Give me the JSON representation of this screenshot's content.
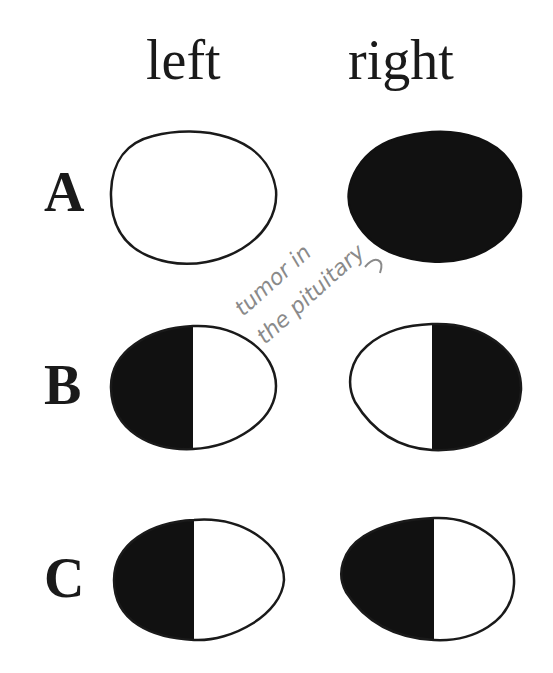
{
  "columns": {
    "left": "left",
    "right": "right"
  },
  "rows": [
    {
      "label": "A",
      "left": "none",
      "right": "full"
    },
    {
      "label": "B",
      "left": "left-half",
      "right": "right-half"
    },
    {
      "label": "C",
      "left": "left-half",
      "right": "left-half"
    }
  ],
  "annotation": {
    "line1": "tumor in",
    "line2": "the pituitary"
  },
  "colors": {
    "ink": "#1a1a1a",
    "fill": "#111111",
    "pencil": "#8a8a8a"
  }
}
